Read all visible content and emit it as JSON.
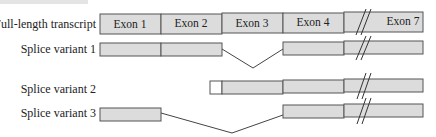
{
  "rows": [
    {
      "label": "Full-length transcript",
      "exons": [
        "Exon 1",
        "Exon 2",
        "Exon 3",
        "Exon 4",
        "Exon 7"
      ]
    },
    {
      "label": "Splice variant 1",
      "exons_included": [
        "Exon 1",
        "Exon 2",
        "Exon 4",
        "...",
        "Exon 7"
      ],
      "skipped": [
        "Exon 3"
      ]
    },
    {
      "label": "Splice variant 2",
      "exons_included": [
        "alternative 5' start",
        "Exon 2",
        "Exon 3",
        "Exon 4",
        "...",
        "Exon 7"
      ],
      "skipped": [
        "Exon 1"
      ]
    },
    {
      "label": "Splice variant 3",
      "exons_included": [
        "Exon 1",
        "Exon 4",
        "...",
        "Exon 7"
      ],
      "skipped": [
        "Exon 2",
        "Exon 3"
      ]
    }
  ],
  "colors": {
    "exon_fill": "#dcdcdc",
    "exon_stroke": "#555555",
    "alt_start_fill": "#ffffff",
    "line": "#444444"
  },
  "break_symbol": "//"
}
